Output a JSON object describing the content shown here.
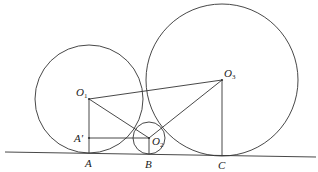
{
  "diagram": {
    "type": "geometry",
    "colors": {
      "stroke": "#333333",
      "background": "#ffffff",
      "text": "#222222"
    },
    "ground_line": {
      "x1": 5,
      "y1": 152,
      "x2": 316,
      "y2": 157
    },
    "circles": [
      {
        "id": "circle-1",
        "center": "O1",
        "cx": 89,
        "cy": 99,
        "r": 54
      },
      {
        "id": "circle-2",
        "center": "O2",
        "cx": 149,
        "cy": 138,
        "r": 16
      },
      {
        "id": "circle-3",
        "center": "O3",
        "cx": 222,
        "cy": 80,
        "r": 76
      }
    ],
    "points": {
      "O1": {
        "x": 89,
        "y": 99
      },
      "O2": {
        "x": 149,
        "y": 138
      },
      "O3": {
        "x": 222,
        "y": 80
      },
      "A": {
        "x": 89,
        "y": 153
      },
      "A_prime": {
        "x": 89,
        "y": 138
      },
      "B": {
        "x": 149,
        "y": 154
      },
      "C": {
        "x": 222,
        "y": 155
      }
    },
    "segments": [
      [
        "O1",
        "O3"
      ],
      [
        "O1",
        "O2"
      ],
      [
        "O2",
        "O3"
      ],
      [
        "O1",
        "A"
      ],
      [
        "O2",
        "B"
      ],
      [
        "O3",
        "C"
      ],
      [
        "A_prime",
        "O2"
      ]
    ],
    "labels": {
      "O1": {
        "main": "O",
        "sub": "1"
      },
      "O2": {
        "main": "O",
        "sub": "2"
      },
      "O3": {
        "main": "O",
        "sub": "3"
      },
      "A": "A",
      "A_prime": "A′",
      "B": "B",
      "C": "C"
    }
  }
}
